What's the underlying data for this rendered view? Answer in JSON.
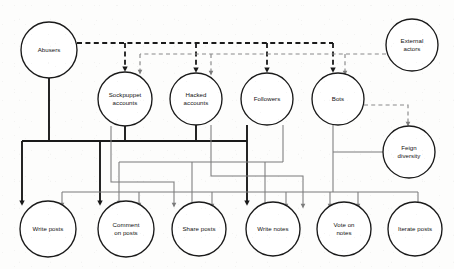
{
  "diagram": {
    "type": "node-link-diagram",
    "canvas": {
      "width": 454,
      "height": 269,
      "background": "#fdfdfc"
    },
    "colors": {
      "node_stroke": "#1a1a1a",
      "node_fill": "#ffffff",
      "edge_primary": "#1a1a1a",
      "edge_secondary": "#7b7b7b",
      "label_text": "#111111"
    },
    "nodes": [
      {
        "id": "abusers",
        "label": "Abusers",
        "label_lines": [
          "Abusers"
        ],
        "cx": 49,
        "cy": 50,
        "r": 28,
        "row": "actors"
      },
      {
        "id": "external",
        "label": "External actors",
        "label_lines": [
          "External",
          "actors"
        ],
        "cx": 412,
        "cy": 45,
        "r": 26,
        "row": "actors"
      },
      {
        "id": "sockpuppet",
        "label": "Sockpuppet accounts",
        "label_lines": [
          "Sockpuppet",
          "accounts"
        ],
        "cx": 125,
        "cy": 99,
        "r": 27,
        "row": "accounts"
      },
      {
        "id": "hacked",
        "label": "Hacked accounts",
        "label_lines": [
          "Hacked",
          "accounts"
        ],
        "cx": 196,
        "cy": 99,
        "r": 26,
        "row": "accounts"
      },
      {
        "id": "followers",
        "label": "Followers",
        "label_lines": [
          "Followers"
        ],
        "cx": 267,
        "cy": 99,
        "r": 26,
        "row": "accounts"
      },
      {
        "id": "bots",
        "label": "Bots",
        "label_lines": [
          "Bots"
        ],
        "cx": 338,
        "cy": 99,
        "r": 26,
        "row": "accounts"
      },
      {
        "id": "feign",
        "label": "Feign diversity",
        "label_lines": [
          "Feign",
          "diversity"
        ],
        "cx": 409,
        "cy": 152,
        "r": 26,
        "row": "tactics"
      },
      {
        "id": "writeposts",
        "label": "Write posts",
        "label_lines": [
          "Write posts"
        ],
        "cx": 48,
        "cy": 229,
        "r": 28,
        "row": "actions"
      },
      {
        "id": "comment",
        "label": "Comment on posts",
        "label_lines": [
          "Comment",
          "on posts"
        ],
        "cx": 126,
        "cy": 229,
        "r": 28,
        "row": "actions"
      },
      {
        "id": "shareposts",
        "label": "Share posts",
        "label_lines": [
          "Share posts"
        ],
        "cx": 199,
        "cy": 229,
        "r": 27,
        "row": "actions"
      },
      {
        "id": "writenotes",
        "label": "Write notes",
        "label_lines": [
          "Write notes"
        ],
        "cx": 273,
        "cy": 229,
        "r": 27,
        "row": "actions"
      },
      {
        "id": "voteonnotes",
        "label": "Vote on notes",
        "label_lines": [
          "Vote on",
          "notes"
        ],
        "cx": 344,
        "cy": 229,
        "r": 27,
        "row": "actions"
      },
      {
        "id": "iterate",
        "label": "Iterate posts",
        "label_lines": [
          "Iterate posts"
        ],
        "cx": 415,
        "cy": 229,
        "r": 27,
        "row": "actions"
      }
    ],
    "edges": [
      {
        "id": "e-abusers-sockpuppet",
        "from": "abusers",
        "to": "sockpuppet",
        "style": "dashed",
        "weight": "primary"
      },
      {
        "id": "e-abusers-hacked",
        "from": "abusers",
        "to": "hacked",
        "style": "dashed",
        "weight": "primary"
      },
      {
        "id": "e-abusers-followers",
        "from": "abusers",
        "to": "followers",
        "style": "dashed",
        "weight": "primary"
      },
      {
        "id": "e-abusers-bots",
        "from": "abusers",
        "to": "bots",
        "style": "dashed",
        "weight": "primary"
      },
      {
        "id": "e-external-sockpuppet",
        "from": "external",
        "to": "sockpuppet",
        "style": "dashed",
        "weight": "secondary"
      },
      {
        "id": "e-external-hacked",
        "from": "external",
        "to": "hacked",
        "style": "dashed",
        "weight": "secondary"
      },
      {
        "id": "e-external-bots",
        "from": "external",
        "to": "bots",
        "style": "dashed",
        "weight": "secondary"
      },
      {
        "id": "e-bots-feign",
        "from": "bots",
        "to": "feign",
        "style": "dashed",
        "weight": "secondary"
      },
      {
        "id": "e-abusers-writeposts",
        "from": "abusers",
        "to": "writeposts",
        "style": "solid",
        "weight": "primary"
      },
      {
        "id": "e-sock-writeposts",
        "from": "sockpuppet",
        "to": "writeposts",
        "style": "solid",
        "weight": "primary"
      },
      {
        "id": "e-sock-comment",
        "from": "sockpuppet",
        "to": "comment",
        "style": "solid",
        "weight": "primary"
      },
      {
        "id": "e-hacked-comment",
        "from": "hacked",
        "to": "comment",
        "style": "solid",
        "weight": "primary"
      },
      {
        "id": "e-hacked-writenotes",
        "from": "hacked",
        "to": "writenotes",
        "style": "solid",
        "weight": "primary"
      },
      {
        "id": "e-followers-writenotes",
        "from": "followers",
        "to": "writenotes",
        "style": "solid",
        "weight": "primary"
      },
      {
        "id": "e-followers-share",
        "from": "followers",
        "to": "shareposts",
        "style": "solid",
        "weight": "secondary"
      },
      {
        "id": "e-followers-vote",
        "from": "followers",
        "to": "voteonnotes",
        "style": "solid",
        "weight": "secondary"
      },
      {
        "id": "e-bots-writeposts",
        "from": "bots",
        "to": "writeposts",
        "style": "solid",
        "weight": "secondary"
      },
      {
        "id": "e-bots-comment",
        "from": "bots",
        "to": "comment",
        "style": "solid",
        "weight": "secondary"
      },
      {
        "id": "e-bots-share",
        "from": "bots",
        "to": "shareposts",
        "style": "secondary"
      },
      {
        "id": "e-bots-vote",
        "from": "bots",
        "to": "voteonnotes",
        "style": "solid",
        "weight": "secondary"
      },
      {
        "id": "e-feign-iterate",
        "from": "feign",
        "to": "iterate",
        "style": "solid",
        "weight": "secondary"
      },
      {
        "id": "e-feign-comment",
        "from": "feign",
        "to": "comment",
        "style": "solid",
        "weight": "secondary"
      }
    ],
    "legend_note": ""
  }
}
